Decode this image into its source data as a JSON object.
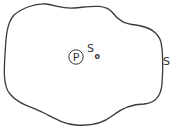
{
  "diagram": {
    "region_label": "S",
    "inner_point_label": "P",
    "inner_surface_label_main": "S",
    "inner_surface_label_sub": "o",
    "stroke_color": "#3a3a3a",
    "background_color": "#ffffff"
  }
}
